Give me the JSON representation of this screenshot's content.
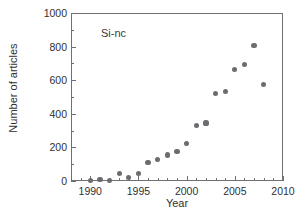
{
  "figure": {
    "background_color": "#ffffff",
    "frame_color": "#6f7073",
    "marker_color": "#6b6c70",
    "text_color": "#2f3033",
    "annotation": "Si-nc"
  },
  "chart_data": {
    "type": "scatter",
    "title": "",
    "xlabel": "Year",
    "ylabel": "Number of articles",
    "xlim": [
      1988,
      2010
    ],
    "ylim": [
      0,
      1000
    ],
    "xticks": [
      1990,
      1995,
      2000,
      2005,
      2010
    ],
    "xtick_labels": [
      "1990",
      "1995",
      "2000",
      "2005",
      "2010"
    ],
    "xtick_minor_step": 1,
    "yticks": [
      0,
      200,
      400,
      600,
      800,
      1000
    ],
    "ytick_labels": [
      "0",
      "200",
      "400",
      "600",
      "800",
      "1000"
    ],
    "ytick_minor_step": 100,
    "grid": false,
    "legend": null,
    "annotations": [
      {
        "text": "Si-nc",
        "x": 1991.5,
        "y": 860
      }
    ],
    "series": [
      {
        "name": "Si-nc",
        "marker": "circle",
        "color": "#6b6c70",
        "x": [
          1990,
          1991,
          1992,
          1993,
          1994,
          1995,
          1996,
          1997,
          1998,
          1999,
          2000,
          2001,
          2002,
          2003,
          2004,
          2005,
          2006,
          2007,
          2008
        ],
        "values": [
          2,
          8,
          5,
          45,
          22,
          47,
          108,
          127,
          155,
          175,
          222,
          332,
          345,
          522,
          535,
          665,
          695,
          808,
          575
        ]
      }
    ]
  }
}
